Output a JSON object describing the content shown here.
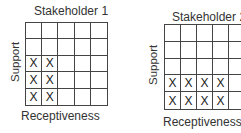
{
  "chart_data": [
    {
      "type": "table",
      "title": "Stakeholder 1",
      "xlabel": "Receptiveness",
      "ylabel": "Support",
      "rows": 5,
      "cols": 5,
      "marked_cells": [
        [
          2,
          0
        ],
        [
          2,
          1
        ],
        [
          3,
          0
        ],
        [
          3,
          1
        ],
        [
          4,
          0
        ],
        [
          4,
          1
        ]
      ],
      "cells": [
        [
          "",
          "",
          "",
          "",
          ""
        ],
        [
          "",
          "",
          "",
          "",
          ""
        ],
        [
          "X",
          "X",
          "",
          "",
          ""
        ],
        [
          "X",
          "X",
          "",
          "",
          ""
        ],
        [
          "X",
          "X",
          "",
          "",
          ""
        ]
      ]
    },
    {
      "type": "table",
      "title": "Stakeholder 2",
      "xlabel": "Receptiveness",
      "ylabel": "Support",
      "rows": 5,
      "cols": 5,
      "marked_cells": [
        [
          3,
          0
        ],
        [
          3,
          1
        ],
        [
          3,
          2
        ],
        [
          3,
          3
        ],
        [
          4,
          0
        ],
        [
          4,
          1
        ],
        [
          4,
          2
        ],
        [
          4,
          3
        ]
      ],
      "cells": [
        [
          "",
          "",
          "",
          "",
          ""
        ],
        [
          "",
          "",
          "",
          "",
          ""
        ],
        [
          "",
          "",
          "",
          "",
          ""
        ],
        [
          "X",
          "X",
          "X",
          "X",
          ""
        ],
        [
          "X",
          "X",
          "X",
          "X",
          ""
        ]
      ]
    }
  ],
  "panels": [
    {
      "title": "Stakeholder 1",
      "ylabel": "Support",
      "xlabel": "Receptiveness"
    },
    {
      "title": "Stakeholder 2",
      "ylabel": "Support",
      "xlabel": "Receptiveness"
    }
  ],
  "mark_symbol": "X",
  "colors": {
    "line": "#444444",
    "text": "#333333",
    "background": "#ffffff"
  }
}
